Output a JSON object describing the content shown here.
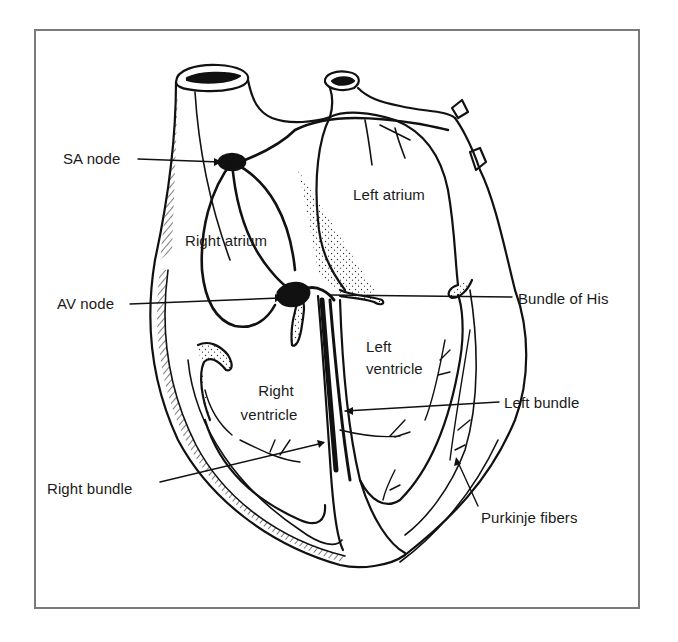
{
  "figure": {
    "border_color": "#7a7a7a",
    "ink_color": "#111111"
  },
  "labels": {
    "sa_node": "SA node",
    "av_node": "AV node",
    "right_atrium": "Right atrium",
    "left_atrium": "Left atrium",
    "bundle_of_his": "Bundle of His",
    "left_ventricle_line1": "Left",
    "left_ventricle_line2": "ventricle",
    "right_ventricle_line1": "Right",
    "right_ventricle_line2": "ventricle",
    "left_bundle": "Left bundle",
    "right_bundle": "Right bundle",
    "purkinje_fibers": "Purkinje fibers"
  }
}
